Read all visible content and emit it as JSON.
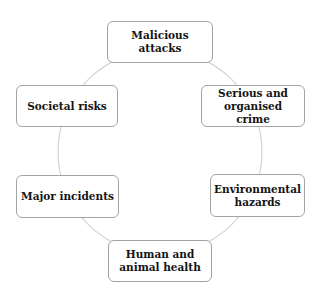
{
  "diagram": {
    "type": "cycle",
    "connector_color": "#d4d4d4",
    "border_color": "#a4a4a4",
    "text_color": "#141414",
    "nodes": [
      {
        "id": "malicious",
        "label_line1": "Malicious",
        "label_line2": "attacks"
      },
      {
        "id": "serious",
        "label_line1": "Serious and",
        "label_line2": "organised crime"
      },
      {
        "id": "environment",
        "label_line1": "Environmental",
        "label_line2": "hazards"
      },
      {
        "id": "health",
        "label_line1": "Human and",
        "label_line2": "animal health"
      },
      {
        "id": "major",
        "label_line1": "Major incidents",
        "label_line2": ""
      },
      {
        "id": "societal",
        "label_line1": "Societal risks",
        "label_line2": ""
      }
    ]
  }
}
